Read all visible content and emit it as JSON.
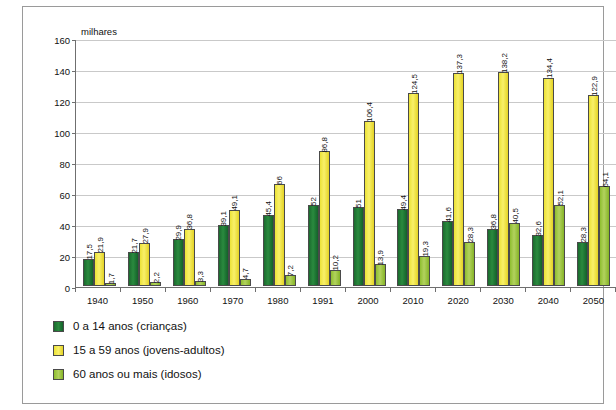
{
  "title_strip": "",
  "credit": "Allmaps/Arquivo da editora",
  "unit_label": "milhares",
  "legend": [
    {
      "label": "0 a 14 anos (crianças)",
      "color": "#2a8a3e"
    },
    {
      "label": "15 a 59 anos (jovens-adultos)",
      "color": "#f0e44a"
    },
    {
      "label": "60 anos ou mais (idosos)",
      "color": "#a5c93c"
    }
  ],
  "chart_data": {
    "type": "bar",
    "title": "",
    "xlabel": "",
    "ylabel": "milhares",
    "ylim": [
      0,
      160
    ],
    "yticks": [
      0,
      20,
      40,
      60,
      80,
      100,
      120,
      140,
      160
    ],
    "grid": true,
    "legend_position": "bottom-left",
    "categories": [
      "1940",
      "1950",
      "1960",
      "1970",
      "1980",
      "1991",
      "2000",
      "2010",
      "2020",
      "2030",
      "2040",
      "2050"
    ],
    "series": [
      {
        "name": "0 a 14 anos (crianças)",
        "color": "#2a8a3e",
        "values": [
          17.5,
          21.7,
          29.9,
          39.1,
          45.4,
          52,
          51,
          49.4,
          41.6,
          36.8,
          32.6,
          28.3
        ],
        "labels": [
          "17,5",
          "21,7",
          "29,9",
          "39,1",
          "45,4",
          "52",
          "51",
          "49,4",
          "41,6",
          "36,8",
          "32,6",
          "28,3"
        ]
      },
      {
        "name": "15 a 59 anos (jovens-adultos)",
        "color": "#f0e44a",
        "values": [
          21.9,
          27.9,
          36.8,
          49.1,
          66,
          86.8,
          106.4,
          124.5,
          137.3,
          138.2,
          134.4,
          122.9
        ],
        "labels": [
          "21,9",
          "27,9",
          "36,8",
          "49,1",
          "66",
          "86,8",
          "106,4",
          "124,5",
          "137,3",
          "138,2",
          "134,4",
          "122,9"
        ]
      },
      {
        "name": "60 anos ou mais (idosos)",
        "color": "#a5c93c",
        "values": [
          1.7,
          2.2,
          3.3,
          4.7,
          7.2,
          10.2,
          13.9,
          19.3,
          28.3,
          40.5,
          52.1,
          64.1
        ],
        "labels": [
          "1,7",
          "2,2",
          "3,3",
          "4,7",
          "7,2",
          "10,2",
          "13,9",
          "19,3",
          "28,3",
          "40,5",
          "52,1",
          "64,1"
        ]
      }
    ]
  }
}
